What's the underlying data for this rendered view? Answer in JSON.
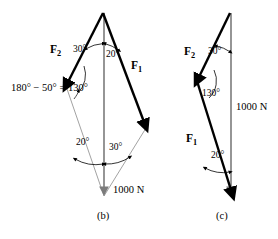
{
  "figure": {
    "type": "vector-force-diagram",
    "background_color": "#ffffff",
    "stroke_color": "#000000",
    "thin_stroke_color": "#808080",
    "panels": [
      {
        "id": "b",
        "caption": "(b)",
        "caption_pos": {
          "x": 97,
          "y": 216
        },
        "vectors": [
          {
            "name": "F2",
            "label": "F",
            "subscript": "2",
            "label_pos": {
              "x": 50,
              "y": 50
            },
            "kind": "thick-arrow",
            "from": {
              "x": 103,
              "y": 13
            },
            "to": {
              "x": 66,
              "y": 86
            }
          },
          {
            "name": "F1",
            "label": "F",
            "subscript": "1",
            "label_pos": {
              "x": 131,
              "y": 66
            },
            "kind": "thick-arrow",
            "from": {
              "x": 103,
              "y": 13
            },
            "to": {
              "x": 146,
              "y": 128
            }
          },
          {
            "name": "resultant-1000N",
            "label": "1000 N",
            "label_pos": {
              "x": 113,
              "y": 188
            },
            "kind": "resultant-arrow",
            "from": {
              "x": 104,
              "y": 13
            },
            "to": {
              "x": 104,
              "y": 196
            }
          },
          {
            "name": "closing-side-left",
            "kind": "thin-line",
            "from": {
              "x": 66,
              "y": 86
            },
            "to": {
              "x": 104,
              "y": 196
            }
          },
          {
            "name": "closing-side-right",
            "kind": "thin-line",
            "from": {
              "x": 146,
              "y": 128
            },
            "to": {
              "x": 104,
              "y": 196
            }
          }
        ],
        "angles": [
          {
            "name": "angle-top-left",
            "text": "30°",
            "pos": {
              "x": 73,
              "y": 51
            }
          },
          {
            "name": "angle-top-right",
            "text": "20°",
            "pos": {
              "x": 106,
              "y": 55
            }
          },
          {
            "name": "angle-bottom-left",
            "text": "20°",
            "pos": {
              "x": 76,
              "y": 143
            }
          },
          {
            "name": "angle-bottom-right",
            "text": "30°",
            "pos": {
              "x": 109,
              "y": 148
            }
          }
        ],
        "annotations": [
          {
            "name": "supplement-angle-equation",
            "text": "180° − 50° = 130°",
            "pos": {
              "x": 11,
              "y": 83
            }
          }
        ]
      },
      {
        "id": "c",
        "caption": "(c)",
        "caption_pos": {
          "x": 216,
          "y": 216
        },
        "vectors": [
          {
            "name": "F2",
            "label": "F",
            "subscript": "2",
            "label_pos": {
              "x": 187,
              "y": 52
            },
            "kind": "thick-arrow",
            "from": {
              "x": 230,
              "y": 13
            },
            "to": {
              "x": 197,
              "y": 81
            }
          },
          {
            "name": "F1",
            "label": "F",
            "subscript": "1",
            "label_pos": {
              "x": 194,
              "y": 139
            },
            "kind": "thick-arrow",
            "from": {
              "x": 197,
              "y": 81
            },
            "to": {
              "x": 233,
              "y": 196
            }
          },
          {
            "name": "resultant-1000N",
            "label": "1000 N",
            "label_pos": {
              "x": 237,
              "y": 105
            },
            "kind": "resultant-arrow",
            "from": {
              "x": 231,
              "y": 13
            },
            "to": {
              "x": 231,
              "y": 196
            }
          }
        ],
        "angles": [
          {
            "name": "angle-top",
            "text": "30°",
            "pos": {
              "x": 208,
              "y": 52
            }
          },
          {
            "name": "angle-vertex",
            "text": "130°",
            "pos": {
              "x": 201,
              "y": 94
            }
          },
          {
            "name": "angle-bottom",
            "text": "20°",
            "pos": {
              "x": 212,
              "y": 156
            }
          }
        ],
        "annotations": []
      }
    ]
  }
}
